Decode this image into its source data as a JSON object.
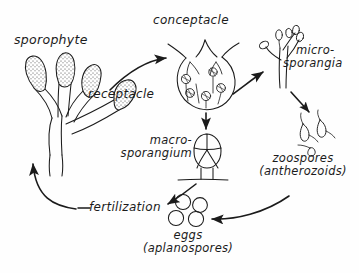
{
  "diagram": {
    "background_color": "#fefefe",
    "ink_color": "#1b1b1b",
    "width": 359,
    "height": 273,
    "labels": {
      "sporophyte": "sporophyte",
      "receptacle": "receptacle",
      "conceptacle": "conceptacle",
      "microsporangia_line1": "micro-",
      "microsporangia_line2": "sporangia",
      "macrosporangium_line1": "macro-",
      "macrosporangium_line2": "sporangium",
      "zoospores_line1": "zoospores",
      "zoospores_line2": "(antherozoids)",
      "fertilization": "fertilization",
      "eggs_line1": "eggs",
      "eggs_line2": "(aplanospores)"
    },
    "structures": [
      {
        "name": "sporophyte-thallus",
        "description": "branched frond with four stippled club-shaped receptacle tips"
      },
      {
        "name": "conceptacle-chamber",
        "description": "round chamber with ostiole opening containing paraphyses and gametangia"
      },
      {
        "name": "microsporangia-cluster",
        "description": "branched filament bearing small oval sporangia"
      },
      {
        "name": "macrosporangium-body",
        "description": "oval body divided into four cells on a short stalk"
      },
      {
        "name": "zoospores-group",
        "description": "three small flagellated pear-shaped cells"
      },
      {
        "name": "eggs-group",
        "description": "four plain circular eggs"
      }
    ],
    "arrows": [
      {
        "name": "arrow-receptacle-to-conceptacle",
        "from": "receptacle",
        "to": "conceptacle"
      },
      {
        "name": "arrow-conceptacle-to-microsporangia",
        "from": "conceptacle",
        "to": "microsporangia"
      },
      {
        "name": "arrow-conceptacle-to-macrosporangium",
        "from": "conceptacle",
        "to": "macrosporangium"
      },
      {
        "name": "arrow-microsporangia-to-zoospores",
        "from": "microsporangia",
        "to": "zoospores"
      },
      {
        "name": "arrow-zoospores-to-eggs",
        "from": "zoospores",
        "to": "eggs"
      },
      {
        "name": "arrow-macrosporangium-to-eggs",
        "from": "macrosporangium",
        "to": "eggs"
      },
      {
        "name": "arrow-fertilization-to-sporophyte",
        "from": "fertilization",
        "to": "sporophyte"
      }
    ]
  }
}
